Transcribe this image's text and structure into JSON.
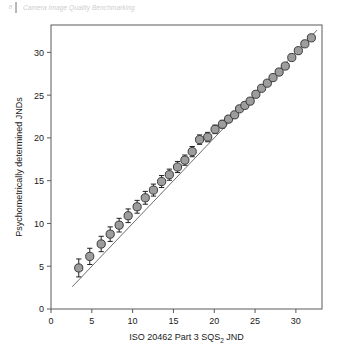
{
  "header": {
    "page_number": "8",
    "title": "Camera Image Quality Benchmarking"
  },
  "figure": {
    "marker_fill": "#9d9d9d",
    "marker_stroke": "#3a3a3a",
    "reference_line_color": "#6e6e6e",
    "axis_color": "#5a5a5a"
  },
  "chart_data": {
    "type": "scatter",
    "title": "",
    "subtitle": "",
    "xlabel": "ISO 20462 Part 3 SQS",
    "xlabel_sub": "2",
    "xlabel_tail": " JND",
    "ylabel": "Psychometrically determined JNDs",
    "xlim": [
      0,
      33.2
    ],
    "ylim": [
      0,
      33.2
    ],
    "xticks": [
      0,
      5,
      10,
      15,
      20,
      25,
      30
    ],
    "yticks": [
      0,
      5,
      10,
      15,
      20,
      25,
      30
    ],
    "xticklabels": [
      "0",
      "5",
      "10",
      "15",
      "20",
      "25",
      "30"
    ],
    "yticklabels": [
      "0",
      "5",
      "10",
      "15",
      "20",
      "25",
      "30"
    ],
    "grid": false,
    "legend": null,
    "reference_line": {
      "type": "identity",
      "label": "1:1 line",
      "x": [
        2.6,
        32.6
      ],
      "y": [
        2.6,
        32.6
      ]
    },
    "series": [
      {
        "name": "Psychometric JND vs SQS2 JND",
        "marker": "circle",
        "error_bar": "yerr",
        "x": [
          3.4,
          4.75,
          6.15,
          7.25,
          8.35,
          9.45,
          10.55,
          11.55,
          12.55,
          13.55,
          14.5,
          15.5,
          16.4,
          17.3,
          18.2,
          19.2,
          20.1,
          21.0,
          21.75,
          22.5,
          23.1,
          23.75,
          24.4,
          25.1,
          25.8,
          26.5,
          27.2,
          27.95,
          28.7,
          29.5,
          30.3,
          31.1,
          31.9
        ],
        "y": [
          4.8,
          6.15,
          7.6,
          8.75,
          9.8,
          10.9,
          11.95,
          13.0,
          13.9,
          14.9,
          15.7,
          16.6,
          17.4,
          18.4,
          19.8,
          20.1,
          21.0,
          21.6,
          22.2,
          22.7,
          23.4,
          23.8,
          24.3,
          25.1,
          25.8,
          26.4,
          27.05,
          27.7,
          28.4,
          29.4,
          30.2,
          31.0,
          31.7
        ],
        "yerr": [
          1.05,
          0.95,
          0.9,
          0.85,
          0.8,
          0.8,
          0.75,
          0.75,
          0.7,
          0.7,
          0.65,
          0.65,
          0.6,
          0.6,
          0.55,
          0.55,
          0.5,
          0.45,
          0.4,
          0.35,
          0.32,
          0.3,
          0.28,
          0.25,
          0.22,
          0.2,
          0.18,
          0.16,
          0.14,
          0.12,
          0.1,
          0.1,
          0.1
        ]
      }
    ]
  }
}
